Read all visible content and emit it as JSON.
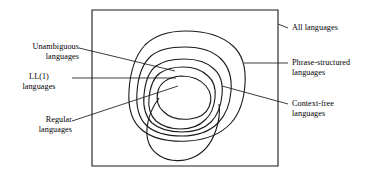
{
  "figure": {
    "background_color": "#ffffff",
    "line_color": "#1a1a1a"
  },
  "labels": {
    "unambiguous": {
      "line1": "Unambiguous",
      "line2": "languages"
    },
    "ll1": {
      "line1": "LL(1)",
      "line2": "languages"
    },
    "regular": {
      "line1": "Regular",
      "line2": "languages"
    },
    "all": {
      "line1": "All languages"
    },
    "phrase_structured": {
      "line1": "Phrase-structured",
      "line2": "languages"
    },
    "context_free": {
      "line1": "Context-free",
      "line2": "languages"
    }
  },
  "regions": [
    {
      "name": "all-languages",
      "shape": "rectangle"
    },
    {
      "name": "phrase-structured-languages",
      "shape": "rounded-blob"
    },
    {
      "name": "context-free-languages",
      "shape": "rounded-blob"
    },
    {
      "name": "unambiguous-languages",
      "shape": "rounded-blob"
    },
    {
      "name": "ll1-languages",
      "shape": "rounded-blob"
    },
    {
      "name": "regular-languages",
      "shape": "rounded-blob"
    }
  ]
}
